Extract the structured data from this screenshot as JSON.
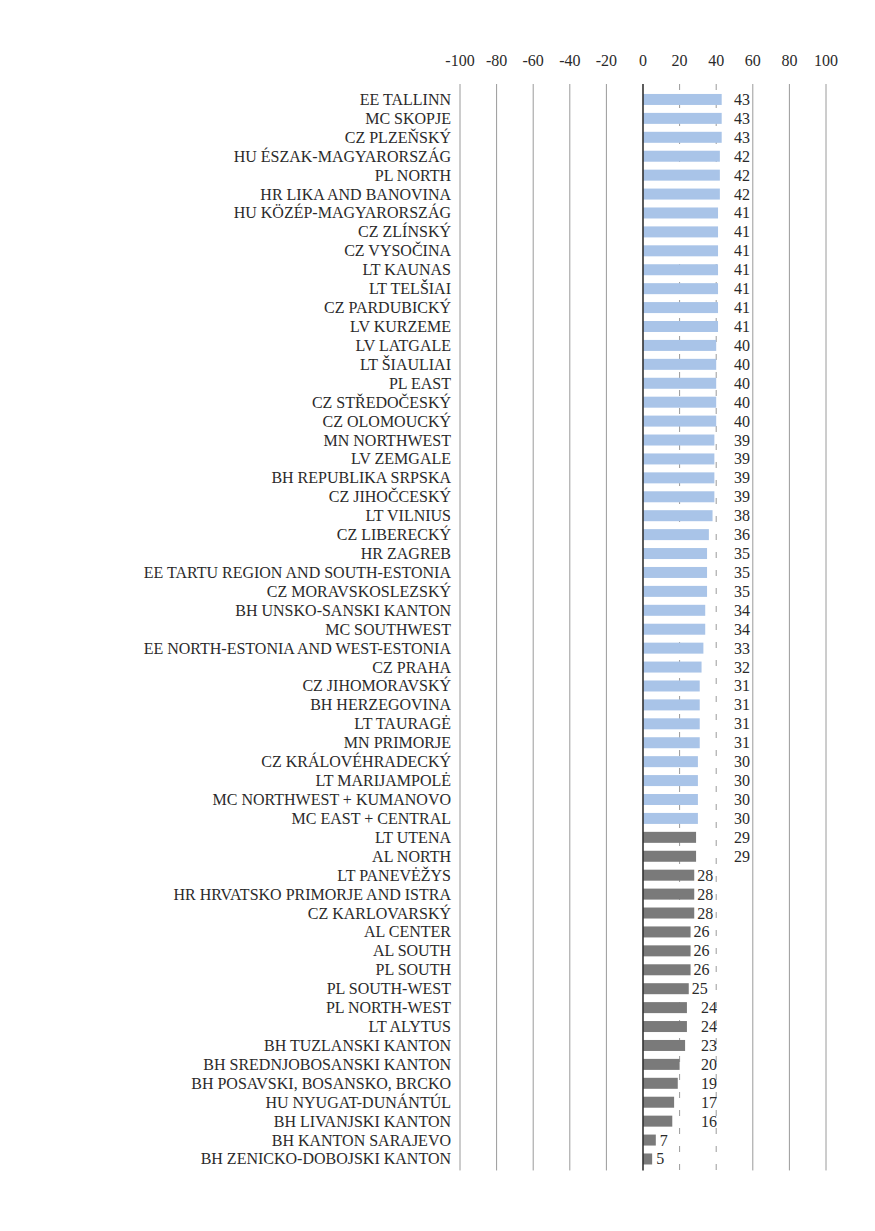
{
  "chart_data": {
    "type": "bar",
    "orientation": "horizontal",
    "title": "",
    "xlabel": "",
    "ylabel": "",
    "xlim": [
      -100,
      100
    ],
    "x_ticks": [
      -100,
      -80,
      -60,
      -40,
      -20,
      0,
      20,
      40,
      60,
      80,
      100
    ],
    "x_tick_labels": [
      "-100",
      "-80",
      "-60",
      "-40",
      "-20",
      "0",
      "20",
      "40",
      "60",
      "80",
      "100"
    ],
    "grid": true,
    "legend": "none",
    "colors": {
      "above_30": "#a9c4e8",
      "below_30": "#7a7a7a"
    },
    "threshold": 30,
    "categories": [
      "EE TALLINN",
      "MC SKOPJE",
      "CZ PLZEŇSKÝ",
      "HU ÉSZAK-MAGYARORSZÁG",
      "PL NORTH",
      "HR LIKA AND BANOVINA",
      "HU KÖZÉP-MAGYARORSZÁG",
      "CZ ZLÍNSKÝ",
      "CZ VYSOČINA",
      "LT KAUNAS",
      "LT TELŠIAI",
      "CZ PARDUBICKÝ",
      "LV KURZEME",
      "LV LATGALE",
      "LT ŠIAULIAI",
      "PL EAST",
      "CZ STŘEDOČESKÝ",
      "CZ OLOMOUCKÝ",
      "MN NORTHWEST",
      "LV ZEMGALE",
      "BH REPUBLIKA SRPSKA",
      "CZ JIHOČCESKÝ",
      "LT VILNIUS",
      "CZ LIBERECKÝ",
      "HR ZAGREB",
      "EE TARTU REGION AND SOUTH-ESTONIA",
      "CZ MORAVSKOSLEZSKÝ",
      "BH UNSKO-SANSKI KANTON",
      "MC SOUTHWEST",
      "EE NORTH-ESTONIA AND WEST-ESTONIA",
      "CZ PRAHA",
      "CZ JIHOMORAVSKÝ",
      "BH HERZEGOVINA",
      "LT TAURAGĖ",
      "MN PRIMORJE",
      "CZ KRÁLOVÉHRADECKÝ",
      "LT MARIJAMPOLĖ",
      "MC NORTHWEST + KUMANOVO",
      "MC EAST + CENTRAL",
      "LT UTENA",
      "AL NORTH",
      "LT PANEVĖŽYS",
      "HR HRVATSKO PRIMORJE AND ISTRA",
      "CZ KARLOVARSKÝ",
      "AL CENTER",
      "AL SOUTH",
      "PL SOUTH",
      "PL SOUTH-WEST",
      "PL NORTH-WEST",
      "LT ALYTUS",
      "BH TUZLANSKI KANTON",
      "BH SREDNJOBOSANSKI KANTON",
      "BH POSAVSKI, BOSANSKO, BRCKO",
      "HU NYUGAT-DUNÁNTÚL",
      "BH LIVANJSKI KANTON",
      "BH KANTON SARAJEVO",
      "BH ZENICKO-DOBOJSKI KANTON"
    ],
    "values": [
      43,
      43,
      43,
      42,
      42,
      42,
      41,
      41,
      41,
      41,
      41,
      41,
      41,
      40,
      40,
      40,
      40,
      40,
      39,
      39,
      39,
      39,
      38,
      36,
      35,
      35,
      35,
      34,
      34,
      33,
      32,
      31,
      31,
      31,
      31,
      30,
      30,
      30,
      30,
      29,
      29,
      28,
      28,
      28,
      26,
      26,
      26,
      25,
      24,
      24,
      23,
      20,
      19,
      17,
      16,
      7,
      5
    ],
    "value_labels": [
      "43",
      "43",
      "43",
      "42",
      "42",
      "42",
      "41",
      "41",
      "41",
      "41",
      "41",
      "41",
      "41",
      "40",
      "40",
      "40",
      "40",
      "40",
      "39",
      "39",
      "39",
      "39",
      "38",
      "36",
      "35",
      "35",
      "35",
      "34",
      "34",
      "33",
      "32",
      "31",
      "31",
      "31",
      "31",
      "30",
      "30",
      "30",
      "30",
      "29",
      "29",
      "28",
      "28",
      "28",
      "26",
      "26",
      "26",
      "25",
      "24",
      "24",
      "23",
      "20",
      "19",
      "17",
      "16",
      "7",
      "5"
    ],
    "bar_color_group": [
      "blue",
      "blue",
      "blue",
      "blue",
      "blue",
      "blue",
      "blue",
      "blue",
      "blue",
      "blue",
      "blue",
      "blue",
      "blue",
      "blue",
      "blue",
      "blue",
      "blue",
      "blue",
      "blue",
      "blue",
      "blue",
      "blue",
      "blue",
      "blue",
      "blue",
      "blue",
      "blue",
      "blue",
      "blue",
      "blue",
      "blue",
      "blue",
      "blue",
      "blue",
      "blue",
      "blue",
      "blue",
      "blue",
      "blue",
      "gray",
      "gray",
      "gray",
      "gray",
      "gray",
      "gray",
      "gray",
      "gray",
      "gray",
      "gray",
      "gray",
      "gray",
      "gray",
      "gray",
      "gray",
      "gray",
      "gray",
      "gray"
    ]
  }
}
